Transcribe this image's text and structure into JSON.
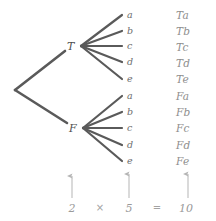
{
  "diagram": {
    "type": "tree-diagram",
    "title": "",
    "colors": {
      "branch": "#5a5a5a",
      "node_text": "#4f4f4f",
      "leaf_text": "#6d6d6d",
      "outcome_text": "#8e8e8e",
      "annotation_text": "#9a9a9a",
      "arrow": "#b5b5b5",
      "background": "#ffffff"
    },
    "root": {
      "name": "root-node",
      "x": 15,
      "y": 90
    },
    "level1": [
      {
        "label": "T",
        "x": 70,
        "y": 46
      },
      {
        "label": "F",
        "x": 72,
        "y": 128
      }
    ],
    "level2_groups": [
      {
        "parent": "T",
        "fan_origin": {
          "x": 81,
          "y": 46
        },
        "leaves": [
          {
            "label": "a",
            "x": 127,
            "y": 15
          },
          {
            "label": "b",
            "x": 127,
            "y": 31
          },
          {
            "label": "c",
            "x": 127,
            "y": 46
          },
          {
            "label": "d",
            "x": 127,
            "y": 62
          },
          {
            "label": "e",
            "x": 127,
            "y": 79
          }
        ]
      },
      {
        "parent": "F",
        "fan_origin": {
          "x": 83,
          "y": 128
        },
        "leaves": [
          {
            "label": "a",
            "x": 127,
            "y": 96
          },
          {
            "label": "b",
            "x": 127,
            "y": 112
          },
          {
            "label": "c",
            "x": 127,
            "y": 128
          },
          {
            "label": "d",
            "x": 127,
            "y": 145
          },
          {
            "label": "e",
            "x": 127,
            "y": 161
          }
        ]
      }
    ],
    "outcomes": [
      {
        "label": "Ta",
        "x": 176,
        "y": 15
      },
      {
        "label": "Tb",
        "x": 176,
        "y": 31
      },
      {
        "label": "Tc",
        "x": 176,
        "y": 47
      },
      {
        "label": "Td",
        "x": 176,
        "y": 63
      },
      {
        "label": "Te",
        "x": 176,
        "y": 79
      },
      {
        "label": "Fa",
        "x": 176,
        "y": 96
      },
      {
        "label": "Fb",
        "x": 176,
        "y": 112
      },
      {
        "label": "Fc",
        "x": 176,
        "y": 128
      },
      {
        "label": "Fd",
        "x": 176,
        "y": 145
      },
      {
        "label": "Fe",
        "x": 176,
        "y": 161
      }
    ],
    "equation": {
      "terms": [
        {
          "text": "2",
          "x": 72,
          "y": 208,
          "arrow_x": 72,
          "arrow_top": 176,
          "arrow_bottom": 198,
          "has_arrow": true
        },
        {
          "text": "×",
          "x": 100,
          "y": 208,
          "has_arrow": false
        },
        {
          "text": "5",
          "x": 129,
          "y": 208,
          "arrow_x": 129,
          "arrow_top": 174,
          "arrow_bottom": 198,
          "has_arrow": true
        },
        {
          "text": "=",
          "x": 157,
          "y": 208,
          "has_arrow": false
        },
        {
          "text": "10",
          "x": 186,
          "y": 208,
          "arrow_x": 188,
          "arrow_top": 174,
          "arrow_bottom": 198,
          "has_arrow": true
        }
      ]
    }
  }
}
